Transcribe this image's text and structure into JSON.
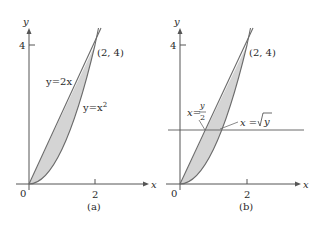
{
  "colors": {
    "axis": "#555555",
    "curve": "#6b6b6b",
    "fill": "#d4d4d4",
    "text": "#2a2a2a"
  },
  "panels": [
    {
      "id": "a",
      "caption": "(a)",
      "axis_x_label": "x",
      "axis_y_label": "y",
      "origin_label": "0",
      "tick_x_label": "2",
      "tick_y_label": "4",
      "point_label": "(2, 4)",
      "line_label": "y=2x",
      "parabola_label_base": "y=x",
      "parabola_label_exp": "2"
    },
    {
      "id": "b",
      "caption": "(b)",
      "axis_x_label": "x",
      "axis_y_label": "y",
      "origin_label": "0",
      "tick_x_label": "2",
      "tick_y_label": "4",
      "point_label": "(2, 4)",
      "line_label_lhs": "x=",
      "line_label_num": "y",
      "line_label_den": "2",
      "sqrt_label_lhs": "x = ",
      "sqrt_label_arg": "y"
    }
  ]
}
